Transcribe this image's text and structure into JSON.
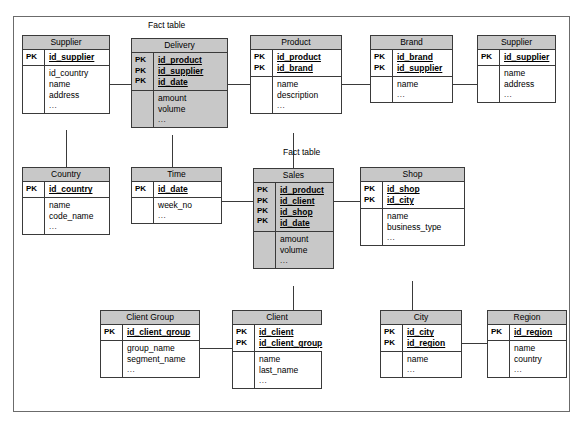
{
  "diagram": {
    "type": "star-schema-er-diagram",
    "fact_table_labels": [
      {
        "text": "Fact table",
        "for": "Delivery"
      },
      {
        "text": "Fact table",
        "for": "Sales"
      }
    ],
    "colors": {
      "fact_fill": "#c8c8c8",
      "header_fill": "#c8c8c8",
      "dimension_fill": "#ffffff",
      "border": "#3a3a3a",
      "frame_border": "#6b6b6b"
    },
    "pk_marker": "PK",
    "ellipsis": "...",
    "entities": [
      {
        "id": "supplier_left",
        "name": "Supplier",
        "is_fact": false,
        "keys": [
          "id_supplier"
        ],
        "attributes": [
          "id_country",
          "name",
          "address",
          "..."
        ]
      },
      {
        "id": "delivery",
        "name": "Delivery",
        "is_fact": true,
        "keys": [
          "id_product",
          "id_supplier",
          "id_date"
        ],
        "attributes": [
          "amount",
          "volume",
          "..."
        ]
      },
      {
        "id": "product",
        "name": "Product",
        "is_fact": false,
        "keys": [
          "id_product",
          "id_brand"
        ],
        "attributes": [
          "name",
          "description",
          "..."
        ]
      },
      {
        "id": "brand",
        "name": "Brand",
        "is_fact": false,
        "keys": [
          "id_brand",
          "id_supplier"
        ],
        "attributes": [
          "name",
          "..."
        ]
      },
      {
        "id": "supplier_right",
        "name": "Supplier",
        "is_fact": false,
        "keys": [
          "id_supplier"
        ],
        "attributes": [
          "name",
          "address",
          "..."
        ]
      },
      {
        "id": "country",
        "name": "Country",
        "is_fact": false,
        "keys": [
          "id_country"
        ],
        "attributes": [
          "name",
          "code_name",
          "..."
        ]
      },
      {
        "id": "time",
        "name": "Time",
        "is_fact": false,
        "keys": [
          "id_date"
        ],
        "attributes": [
          "week_no",
          "..."
        ]
      },
      {
        "id": "sales",
        "name": "Sales",
        "is_fact": true,
        "keys": [
          "id_product",
          "id_client",
          "id_shop",
          "id_date"
        ],
        "attributes": [
          "amount",
          "volume",
          "..."
        ]
      },
      {
        "id": "shop",
        "name": "Shop",
        "is_fact": false,
        "keys": [
          "id_shop",
          "id_city"
        ],
        "attributes": [
          "name",
          "business_type",
          "..."
        ]
      },
      {
        "id": "client_group",
        "name": "Client Group",
        "is_fact": false,
        "keys": [
          "id_client_group"
        ],
        "attributes": [
          "group_name",
          "segment_name",
          "..."
        ]
      },
      {
        "id": "client",
        "name": "Client",
        "is_fact": false,
        "keys": [
          "id_client",
          "id_client_group"
        ],
        "attributes": [
          "name",
          "last_name",
          "..."
        ]
      },
      {
        "id": "city",
        "name": "City",
        "is_fact": false,
        "keys": [
          "id_city",
          "id_region"
        ],
        "attributes": [
          "name",
          "..."
        ]
      },
      {
        "id": "region",
        "name": "Region",
        "is_fact": false,
        "keys": [
          "id_region"
        ],
        "attributes": [
          "name",
          "country",
          "..."
        ]
      }
    ],
    "relationships": [
      {
        "from": "supplier_left",
        "to": "delivery"
      },
      {
        "from": "delivery",
        "to": "product"
      },
      {
        "from": "product",
        "to": "brand"
      },
      {
        "from": "brand",
        "to": "supplier_right"
      },
      {
        "from": "supplier_left",
        "to": "country"
      },
      {
        "from": "delivery",
        "to": "time"
      },
      {
        "from": "time",
        "to": "sales"
      },
      {
        "from": "product",
        "to": "sales"
      },
      {
        "from": "sales",
        "to": "shop"
      },
      {
        "from": "sales",
        "to": "client"
      },
      {
        "from": "client_group",
        "to": "client"
      },
      {
        "from": "shop",
        "to": "city"
      },
      {
        "from": "city",
        "to": "region"
      }
    ]
  }
}
